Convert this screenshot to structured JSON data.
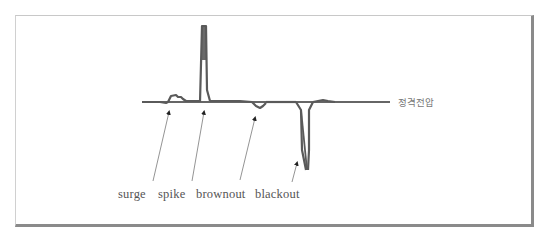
{
  "diagram": {
    "title": "",
    "reference_line_label": "정격전압",
    "events": [
      {
        "id": "surge",
        "label": "surge"
      },
      {
        "id": "spike",
        "label": "spike"
      },
      {
        "id": "brownout",
        "label": "brownout"
      },
      {
        "id": "blackout",
        "label": "blackout"
      }
    ],
    "colors": {
      "waveform": "#5a5a5a",
      "reference_line": "#333333",
      "arrow": "#555555",
      "frame_shadow": "#8a8a8a"
    }
  }
}
